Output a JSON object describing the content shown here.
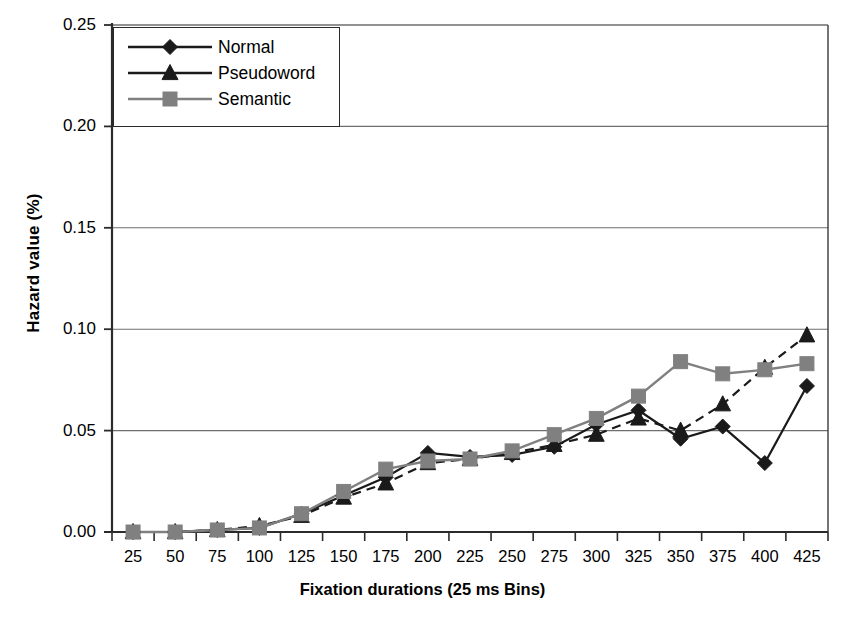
{
  "chart_data": {
    "type": "line",
    "title": "",
    "xlabel": "Fixation durations (25 ms Bins)",
    "ylabel": "Hazard value (%)",
    "categories": [
      25,
      50,
      75,
      100,
      125,
      150,
      175,
      200,
      225,
      250,
      275,
      300,
      325,
      350,
      375,
      400,
      425
    ],
    "xtick_labels": [
      "25",
      "50",
      "75",
      "100",
      "125",
      "150",
      "175",
      "200",
      "225",
      "250",
      "275",
      "300",
      "325",
      "350",
      "375",
      "400",
      "425"
    ],
    "ytick_labels": [
      "0.25",
      "0.20",
      "0.15",
      "0.10",
      "0.05",
      "0.00"
    ],
    "ytick_values": [
      0.25,
      0.2,
      0.15,
      0.1,
      0.05,
      0.0
    ],
    "ylim": [
      0.0,
      0.25
    ],
    "grid": "horizontal",
    "legend_position": "top-left-inside",
    "series": [
      {
        "name": "Normal",
        "marker": "diamond",
        "color": "#1a1a1a",
        "linestyle": "solid",
        "values": [
          0.0,
          0.0,
          0.001,
          0.002,
          0.009,
          0.018,
          0.027,
          0.039,
          0.037,
          0.038,
          0.042,
          0.053,
          0.06,
          0.046,
          0.052,
          0.034,
          0.072
        ]
      },
      {
        "name": "Pseudoword",
        "marker": "triangle",
        "color": "#1a1a1a",
        "linestyle": "dashed",
        "values": [
          0.0,
          0.0,
          0.001,
          0.003,
          0.008,
          0.017,
          0.024,
          0.034,
          0.036,
          0.039,
          0.043,
          0.048,
          0.056,
          0.05,
          0.063,
          0.081,
          0.097
        ]
      },
      {
        "name": "Semantic",
        "marker": "square",
        "color": "#808080",
        "linestyle": "solid",
        "values": [
          0.0,
          0.0,
          0.001,
          0.002,
          0.009,
          0.02,
          0.031,
          0.035,
          0.036,
          0.04,
          0.048,
          0.056,
          0.067,
          0.084,
          0.078,
          0.08,
          0.083
        ]
      }
    ]
  },
  "legend": {
    "items": [
      {
        "label": "Normal"
      },
      {
        "label": "Pseudoword"
      },
      {
        "label": "Semantic"
      }
    ]
  },
  "axes": {
    "y_title": "Hazard value (%)",
    "x_title": "Fixation durations (25 ms Bins)"
  },
  "caption": {
    "text": ""
  }
}
